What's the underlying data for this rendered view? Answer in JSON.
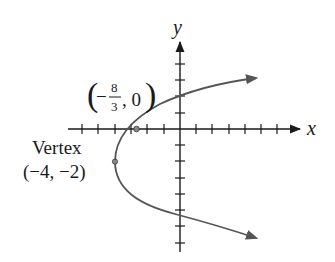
{
  "figure": {
    "axes": {
      "x_label": "x",
      "y_label": "y",
      "x_ticks": [
        -6,
        -5,
        -4,
        -3,
        -2,
        -1,
        1,
        2,
        3,
        4,
        5,
        6
      ],
      "y_ticks": [
        4,
        3,
        2,
        1,
        -1,
        -2,
        -3,
        -4,
        -5,
        -6,
        -7
      ],
      "tick_labels_shown": false
    },
    "curve": {
      "type": "parabola",
      "equation": "x = (1/3)(y + 2)^2 - 4",
      "opens": "right",
      "color": "#555555",
      "arrows": "both ends"
    },
    "points": [
      {
        "name": "x-intercept",
        "x": -2.6667,
        "y": 0,
        "label_prefix": "(−",
        "label_num": "8",
        "label_den": "3",
        "label_suffix": ", 0)"
      },
      {
        "name": "vertex",
        "x": -4,
        "y": -2,
        "label_title": "Vertex",
        "label_coords": "(−4, −2)"
      }
    ]
  }
}
